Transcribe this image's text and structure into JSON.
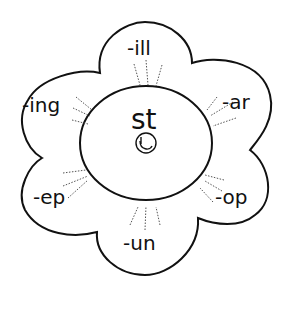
{
  "diagram": {
    "center_label": "st",
    "center_icon": "smiley-face-icon",
    "petals": [
      {
        "id": "top",
        "label": "-ill"
      },
      {
        "id": "upper-right",
        "label": "-ar"
      },
      {
        "id": "lower-right",
        "label": "-op"
      },
      {
        "id": "bottom",
        "label": "-un"
      },
      {
        "id": "lower-left",
        "label": "-ep"
      },
      {
        "id": "upper-left",
        "label": "-ing"
      }
    ]
  }
}
